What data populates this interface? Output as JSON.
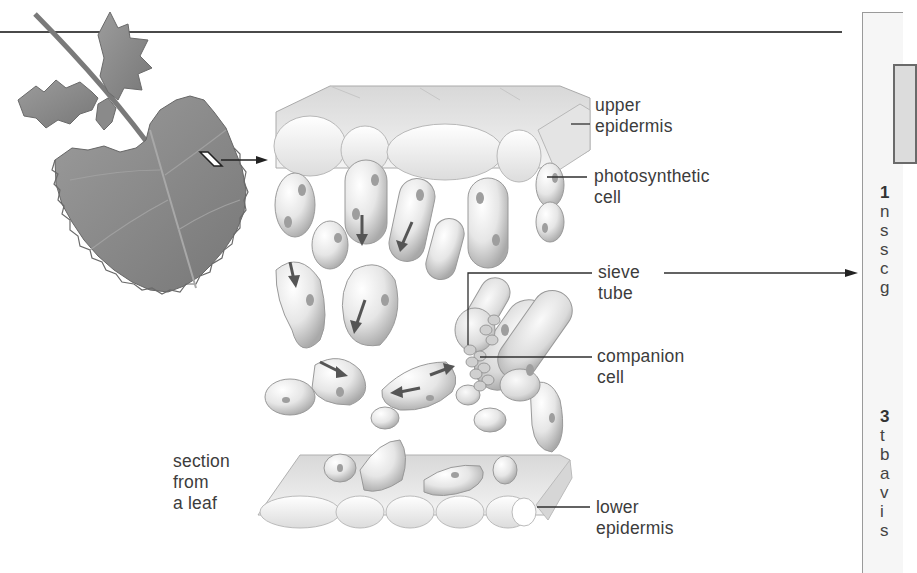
{
  "figure": {
    "type": "biology-diagram"
  },
  "labels": {
    "upper_epidermis": [
      "upper",
      "epidermis"
    ],
    "photosynthetic_cell": [
      "photosynthetic",
      "cell"
    ],
    "sieve_tube": [
      "sieve",
      "tube"
    ],
    "companion_cell": [
      "companion",
      "cell"
    ],
    "lower_epidermis": [
      "lower",
      "epidermis"
    ],
    "section_from_leaf": [
      "section",
      "from",
      "a leaf"
    ]
  },
  "side_panel": {
    "paragraph_1_lines": [
      "1",
      "n",
      "s",
      "s",
      "c",
      "g"
    ],
    "paragraph_2_lines": [
      "3",
      "t",
      "b",
      "a",
      "v",
      "i",
      "s"
    ]
  },
  "colors": {
    "leaf": "#8c8c8c",
    "leaf_dark": "#6e6e6e",
    "cell_fill": "#eeeeee",
    "cell_shade": "#bdbdbd",
    "chloroplast": "#9a9a9a",
    "line": "#2f2f2f"
  }
}
